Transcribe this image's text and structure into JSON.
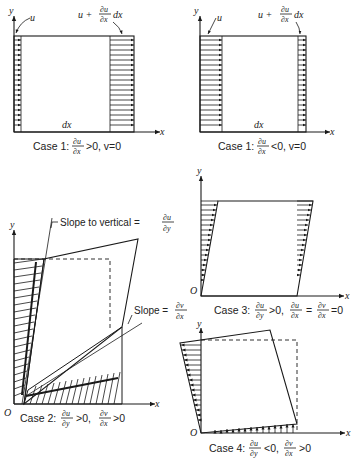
{
  "figure": {
    "panels": [
      {
        "id": "case1a",
        "caption": {
          "prefix": "Case 1:",
          "num": "∂u",
          "den": "∂x",
          "rest": ">0, v=0"
        },
        "labels": {
          "y": "y",
          "x": "x",
          "u": "u",
          "u_plus": "u +",
          "frac_num": "∂u",
          "frac_den": "∂x",
          "dx_suffix": "dx",
          "dx": "dx"
        }
      },
      {
        "id": "case1b",
        "caption": {
          "prefix": "Case 1:",
          "num": "∂u",
          "den": "∂x",
          "rest": "<0, v=0"
        },
        "labels": {
          "y": "y",
          "x": "x",
          "u": "u",
          "u_plus": "u +",
          "frac_num": "∂u",
          "frac_den": "∂x",
          "dx_suffix": "dx",
          "dx": "dx"
        }
      },
      {
        "id": "case2",
        "caption": {
          "prefix": "Case 2:",
          "num1": "∂u",
          "den1": "∂y",
          "mid": ">0,",
          "num2": "∂v",
          "den2": "∂x",
          "rest": ">0"
        },
        "labels": {
          "y": "y",
          "x": "x",
          "origin": "O",
          "slope_vertical": "Slope to vertical =",
          "sv_num": "∂u",
          "sv_den": "∂y",
          "slope": "Slope =",
          "s_num": "∂v",
          "s_den": "∂x"
        }
      },
      {
        "id": "case3",
        "caption": {
          "prefix": "Case 3:",
          "num1": "∂u",
          "den1": "∂y",
          "mid1": ">0,",
          "num2": "∂u",
          "den2": "∂x",
          "mid2": "=",
          "num3": "∂v",
          "den3": "∂x",
          "rest": "=0"
        },
        "labels": {
          "y": "y",
          "x": "x",
          "origin": "O"
        }
      },
      {
        "id": "case4",
        "caption": {
          "prefix": "Case 4:",
          "num1": "∂u",
          "den1": "∂y",
          "mid": "<0,",
          "num2": "∂v",
          "den2": "∂x",
          "rest": ">0"
        },
        "labels": {
          "y": "y",
          "x": "x",
          "origin": "O"
        }
      }
    ]
  }
}
